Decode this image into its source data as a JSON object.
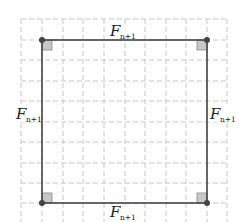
{
  "diagram": {
    "type": "square-on-grid",
    "side_label": {
      "main": "F",
      "subscript": "n+1"
    },
    "labels": {
      "top": {
        "main": "F",
        "sub": "n+1"
      },
      "bottom": {
        "main": "F",
        "sub": "n+1"
      },
      "left": {
        "main": "F",
        "sub": "n+1"
      },
      "right": {
        "main": "F",
        "sub": "n+1"
      }
    },
    "right_angle_markers": 4,
    "vertices": 4,
    "grid": {
      "style": "dashed",
      "color": "#c8c8c8"
    },
    "colors": {
      "square_stroke": "#444444",
      "vertex": "#444444",
      "right_angle_fill": "#c8c8c8",
      "right_angle_stroke": "#888888"
    }
  }
}
